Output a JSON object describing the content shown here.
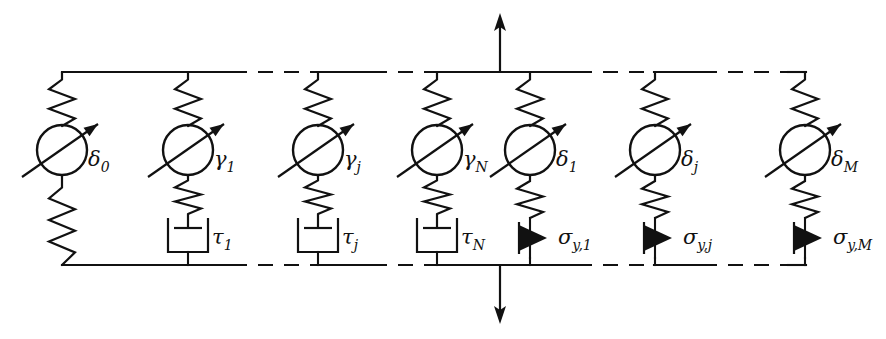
{
  "figure": {
    "type": "rheological-network-diagram",
    "canvas": {
      "width": 886,
      "height": 339
    },
    "colors": {
      "line": "#111111",
      "background": "#ffffff",
      "fill": "#111111"
    }
  },
  "frame": {
    "top_rail_y": 72,
    "bottom_rail_y": 265,
    "left_x": 62,
    "right_x": 805,
    "dashed_gap_regions": [
      {
        "from": 232,
        "to": 318
      },
      {
        "from": 370,
        "to": 437
      },
      {
        "from": 575,
        "to": 655
      },
      {
        "from": 700,
        "to": 790
      }
    ]
  },
  "load_arrows": {
    "top": {
      "label": "tension-arrow-up",
      "x": 500,
      "from_y": 72,
      "to_y": 14,
      "direction": "up"
    },
    "bottom": {
      "label": "tension-arrow-down",
      "x": 500,
      "from_y": 265,
      "to_y": 323,
      "direction": "down"
    }
  },
  "branches": [
    {
      "id": "branch-delta-0",
      "x": 62,
      "element_label": "δ",
      "element_sub": "0",
      "element_kind": "variable-spring",
      "second_label": null,
      "second_sub": null,
      "second_kind": "spring",
      "label_x": 88,
      "label_y": 166
    },
    {
      "id": "branch-gamma-1",
      "x": 188,
      "element_label": "γ",
      "element_sub": "1",
      "element_kind": "variable-spring",
      "second_label": "τ",
      "second_sub": "1",
      "second_kind": "dashpot",
      "label_x": 214,
      "label_y": 166
    },
    {
      "id": "branch-gamma-j",
      "x": 318,
      "element_label": "γ",
      "element_sub": "j",
      "element_kind": "variable-spring",
      "second_label": "τ",
      "second_sub": "j",
      "second_kind": "dashpot",
      "label_x": 344,
      "label_y": 166
    },
    {
      "id": "branch-gamma-N",
      "x": 437,
      "element_label": "γ",
      "element_sub": "N",
      "element_kind": "variable-spring",
      "second_label": "τ",
      "second_sub": "N",
      "second_kind": "dashpot",
      "label_x": 463,
      "label_y": 166
    },
    {
      "id": "branch-delta-1",
      "x": 530,
      "element_label": "δ",
      "element_sub": "1",
      "element_kind": "variable-spring",
      "second_label": "σ",
      "second_sub": "y,1",
      "second_kind": "friction",
      "label_x": 556,
      "label_y": 166
    },
    {
      "id": "branch-delta-j",
      "x": 655,
      "element_label": "δ",
      "element_sub": "j",
      "element_kind": "variable-spring",
      "second_label": "σ",
      "second_sub": "y,j",
      "second_kind": "friction",
      "label_x": 681,
      "label_y": 166
    },
    {
      "id": "branch-delta-M",
      "x": 805,
      "element_label": "δ",
      "element_sub": "M",
      "element_kind": "variable-spring",
      "second_label": "σ",
      "second_sub": "y,M",
      "second_kind": "friction",
      "label_x": 831,
      "label_y": 166
    }
  ],
  "element_labels": [
    {
      "name": "label-delta-0",
      "text": "δ",
      "sub": "0"
    },
    {
      "name": "label-gamma-1",
      "text": "γ",
      "sub": "1"
    },
    {
      "name": "label-gamma-j",
      "text": "γ",
      "sub": "j"
    },
    {
      "name": "label-gamma-N",
      "text": "γ",
      "sub": "N"
    },
    {
      "name": "label-delta-1",
      "text": "δ",
      "sub": "1"
    },
    {
      "name": "label-delta-j",
      "text": "δ",
      "sub": "j"
    },
    {
      "name": "label-delta-M",
      "text": "δ",
      "sub": "M"
    },
    {
      "name": "label-tau-1",
      "text": "τ",
      "sub": "1"
    },
    {
      "name": "label-tau-j",
      "text": "τ",
      "sub": "j"
    },
    {
      "name": "label-tau-N",
      "text": "τ",
      "sub": "N"
    },
    {
      "name": "label-sigma-y-1",
      "text": "σ",
      "sub": "y,1"
    },
    {
      "name": "label-sigma-y-j",
      "text": "σ",
      "sub": "y,j"
    },
    {
      "name": "label-sigma-y-M",
      "text": "σ",
      "sub": "y,M"
    }
  ],
  "second_labels": [
    {
      "branch": "branch-gamma-1",
      "text": "τ",
      "sub": "1",
      "x": 212,
      "y": 244
    },
    {
      "branch": "branch-gamma-j",
      "text": "τ",
      "sub": "j",
      "x": 342,
      "y": 244
    },
    {
      "branch": "branch-gamma-N",
      "text": "τ",
      "sub": "N",
      "x": 461,
      "y": 244
    },
    {
      "branch": "branch-delta-1",
      "text": "σ",
      "sub": "y,1",
      "x": 558,
      "y": 244
    },
    {
      "branch": "branch-delta-j",
      "text": "σ",
      "sub": "y,j",
      "x": 683,
      "y": 244
    },
    {
      "branch": "branch-delta-M",
      "text": "σ",
      "sub": "y,M",
      "x": 833,
      "y": 244
    }
  ]
}
